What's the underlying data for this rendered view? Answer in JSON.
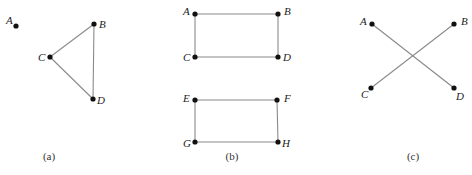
{
  "figure": {
    "panels": [
      {
        "id": "a",
        "caption": "(a)",
        "caption_pos": [
          49,
          160
        ],
        "vertices": [
          {
            "name": "A",
            "x": 16,
            "y": 26,
            "lx": 6,
            "ly": 24,
            "anchor": "end-ish"
          },
          {
            "name": "B",
            "x": 94,
            "y": 24,
            "lx": 99,
            "ly": 28
          },
          {
            "name": "C",
            "x": 50,
            "y": 57,
            "lx": 38,
            "ly": 61
          },
          {
            "name": "D",
            "x": 93,
            "y": 99,
            "lx": 97,
            "ly": 104
          }
        ],
        "edges": [
          [
            "B",
            "C"
          ],
          [
            "C",
            "D"
          ],
          [
            "B",
            "D"
          ]
        ]
      },
      {
        "id": "b",
        "caption": "(b)",
        "caption_pos": [
          232,
          160
        ],
        "vertices": [
          {
            "name": "A",
            "x": 195,
            "y": 14,
            "lx": 183,
            "ly": 15
          },
          {
            "name": "B",
            "x": 278,
            "y": 14,
            "lx": 284,
            "ly": 15
          },
          {
            "name": "C",
            "x": 195,
            "y": 57,
            "lx": 183,
            "ly": 61
          },
          {
            "name": "D",
            "x": 278,
            "y": 57,
            "lx": 283,
            "ly": 61
          },
          {
            "name": "E",
            "x": 195,
            "y": 100,
            "lx": 183,
            "ly": 102
          },
          {
            "name": "F",
            "x": 277,
            "y": 100,
            "lx": 284,
            "ly": 102
          },
          {
            "name": "G",
            "x": 195,
            "y": 142,
            "lx": 183,
            "ly": 147
          },
          {
            "name": "H",
            "x": 278,
            "y": 142,
            "lx": 282,
            "ly": 147
          }
        ],
        "edges": [
          [
            "A",
            "B"
          ],
          [
            "A",
            "C"
          ],
          [
            "C",
            "D"
          ],
          [
            "B",
            "D"
          ],
          [
            "E",
            "F"
          ],
          [
            "E",
            "G"
          ],
          [
            "G",
            "H"
          ],
          [
            "F",
            "H"
          ]
        ]
      },
      {
        "id": "c",
        "caption": "(c)",
        "caption_pos": [
          413,
          160
        ],
        "vertices": [
          {
            "name": "A",
            "x": 372,
            "y": 24,
            "lx": 360,
            "ly": 25
          },
          {
            "name": "B",
            "x": 454,
            "y": 24,
            "lx": 461,
            "ly": 25
          },
          {
            "name": "C",
            "x": 371,
            "y": 88,
            "lx": 361,
            "ly": 98
          },
          {
            "name": "D",
            "x": 454,
            "y": 88,
            "lx": 456,
            "ly": 100
          }
        ],
        "edges": [
          [
            "A",
            "D"
          ],
          [
            "B",
            "C"
          ]
        ]
      }
    ]
  }
}
